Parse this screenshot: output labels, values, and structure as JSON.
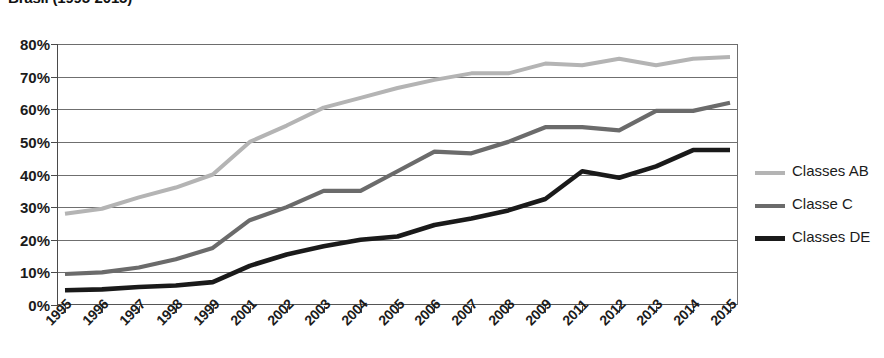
{
  "chart_data": {
    "type": "line",
    "title": "Brasil (1995-2015)",
    "xlabel": "",
    "ylabel": "",
    "ylim": [
      0,
      80
    ],
    "ytick_step": 10,
    "grid": true,
    "legend_position": "right",
    "categories": [
      "1995",
      "1996",
      "1997",
      "1998",
      "1999",
      "2001",
      "2002",
      "2003",
      "2004",
      "2005",
      "2006",
      "2007",
      "2008",
      "2009",
      "2011",
      "2012",
      "2013",
      "2014",
      "2015"
    ],
    "ytick_labels": [
      "80%",
      "70%",
      "60%",
      "50%",
      "40%",
      "30%",
      "20%",
      "10%",
      "0%"
    ],
    "ytick_values": [
      80,
      70,
      60,
      50,
      40,
      30,
      20,
      10,
      0
    ],
    "series": [
      {
        "name": "Classes AB",
        "color": "#b4b4b4",
        "values": [
          28,
          29.5,
          33,
          36,
          40,
          50,
          55,
          60.5,
          63.5,
          66.5,
          69,
          71,
          71,
          74,
          73.5,
          75.5,
          73.5,
          75.5,
          76
        ]
      },
      {
        "name": "Classe C",
        "color": "#6b6b6b",
        "values": [
          9.5,
          10,
          11.5,
          14,
          17.5,
          26,
          30,
          35,
          35,
          41,
          47,
          46.5,
          50,
          54.5,
          54.5,
          53.5,
          59.5,
          59.5,
          62
        ]
      },
      {
        "name": "Classes DE",
        "color": "#1a1a1a",
        "values": [
          4.5,
          4.8,
          5.5,
          6,
          7,
          12,
          15.5,
          18,
          20,
          21,
          24.5,
          26.5,
          29,
          32.5,
          41,
          39,
          42.5,
          47.5,
          47.5
        ]
      }
    ]
  },
  "legend": {
    "items": [
      {
        "label": "Classes AB",
        "color": "#b4b4b4"
      },
      {
        "label": "Classe C",
        "color": "#6b6b6b"
      },
      {
        "label": "Classes DE",
        "color": "#1a1a1a"
      }
    ]
  }
}
